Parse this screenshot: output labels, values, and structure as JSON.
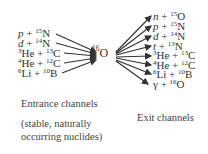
{
  "diagram": {
    "center": {
      "mass": "16",
      "symbol": "O"
    },
    "entrance_channels": [
      {
        "a": "p",
        "a_italic": true,
        "a_mass": "",
        "b_mass": "15",
        "b": "N"
      },
      {
        "a": "d",
        "a_italic": true,
        "a_mass": "",
        "b_mass": "14",
        "b": "N"
      },
      {
        "a": "He",
        "a_italic": false,
        "a_mass": "3",
        "b_mass": "13",
        "b": "C"
      },
      {
        "a": "He",
        "a_italic": false,
        "a_mass": "4",
        "b_mass": "12",
        "b": "C"
      },
      {
        "a": "Li",
        "a_italic": false,
        "a_mass": "6",
        "b_mass": "10",
        "b": "B"
      }
    ],
    "exit_channels": [
      {
        "a": "n",
        "a_italic": true,
        "a_mass": "",
        "b_mass": "15",
        "b": "O"
      },
      {
        "a": "p",
        "a_italic": true,
        "a_mass": "",
        "b_mass": "15",
        "b": "N"
      },
      {
        "a": "d",
        "a_italic": true,
        "a_mass": "",
        "b_mass": "14",
        "b": "N"
      },
      {
        "a": "t",
        "a_italic": true,
        "a_mass": "",
        "b_mass": "13",
        "b": "N"
      },
      {
        "a": "He",
        "a_italic": false,
        "a_mass": "3",
        "b_mass": "13",
        "b": "C"
      },
      {
        "a": "He",
        "a_italic": false,
        "a_mass": "4",
        "b_mass": "12",
        "b": "C"
      },
      {
        "a": "Li",
        "a_italic": false,
        "a_mass": "6",
        "b_mass": "10",
        "b": "B"
      },
      {
        "a": "γ",
        "a_italic": false,
        "a_mass": "",
        "b_mass": "16",
        "b": "O"
      }
    ],
    "plus": "+",
    "entrance_caption": "Entrance channels",
    "entrance_note_line1": "(stable, naturally",
    "entrance_note_line2": "occurring nuclides)",
    "exit_caption": "Exit channels"
  }
}
